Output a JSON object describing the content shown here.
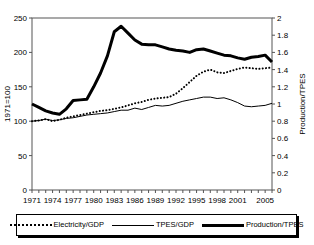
{
  "chart_data": {
    "type": "line",
    "title": "",
    "xlabel": "",
    "ylabel": "1971=100",
    "y2label": "Production/TPES",
    "x": [
      1971,
      1972,
      1973,
      1974,
      1975,
      1976,
      1977,
      1978,
      1979,
      1980,
      1981,
      1982,
      1983,
      1984,
      1985,
      1986,
      1987,
      1988,
      1989,
      1990,
      1991,
      1992,
      1993,
      1994,
      1995,
      1996,
      1997,
      1998,
      1999,
      2000,
      2001,
      2002,
      2003,
      2004,
      2005,
      2006
    ],
    "xtick_labels": [
      "1971",
      "1974",
      "1977",
      "1980",
      "1983",
      "1986",
      "1989",
      "1992",
      "1995",
      "1998",
      "2001",
      "2005"
    ],
    "xtick_values": [
      1971,
      1974,
      1977,
      1980,
      1983,
      1986,
      1989,
      1992,
      1995,
      1998,
      2001,
      2005
    ],
    "ylim": [
      0,
      250
    ],
    "ytick_labels": [
      "0",
      "50",
      "100",
      "150",
      "200",
      "250"
    ],
    "ytick_values": [
      0,
      50,
      100,
      150,
      200,
      250
    ],
    "y2lim": [
      0,
      2
    ],
    "y2tick_labels": [
      "0",
      "0.2",
      "0.4",
      "0.6",
      "0.8",
      "1",
      "1.2",
      "1.4",
      "1.6",
      "1.8",
      "2"
    ],
    "y2tick_values": [
      0,
      0.2,
      0.4,
      0.6,
      0.8,
      1,
      1.2,
      1.4,
      1.6,
      1.8,
      2
    ],
    "grid": false,
    "legend_position": "bottom",
    "series": [
      {
        "name": "Electricity/GDP",
        "style": "dotted",
        "axis": "left",
        "values": [
          100,
          101,
          103,
          100,
          102,
          105,
          107,
          109,
          111,
          113,
          115,
          116,
          118,
          120,
          123,
          126,
          128,
          131,
          133,
          134,
          135,
          140,
          148,
          157,
          166,
          172,
          175,
          171,
          170,
          173,
          176,
          178,
          177,
          176,
          177,
          178
        ]
      },
      {
        "name": "TPES/GDP",
        "style": "thin",
        "axis": "left",
        "values": [
          100,
          101,
          103,
          101,
          102,
          104,
          105,
          107,
          109,
          110,
          111,
          112,
          114,
          116,
          116,
          119,
          117,
          120,
          123,
          122,
          123,
          126,
          129,
          131,
          133,
          135,
          135,
          133,
          134,
          131,
          127,
          122,
          121,
          122,
          123,
          126
        ]
      },
      {
        "name": "Production/TPES",
        "style": "thick",
        "axis": "left",
        "values": [
          125,
          120,
          115,
          112,
          110,
          118,
          130,
          131,
          132,
          150,
          170,
          195,
          230,
          238,
          228,
          218,
          212,
          211,
          211,
          208,
          205,
          203,
          202,
          200,
          204,
          205,
          202,
          199,
          196,
          195,
          192,
          190,
          193,
          194,
          196,
          186
        ]
      }
    ]
  },
  "legend": {
    "items": [
      {
        "label": "Electricity/GDP",
        "style": "dotted"
      },
      {
        "label": "TPES/GDP",
        "style": "thin"
      },
      {
        "label": "Production/TPES",
        "style": "thick"
      }
    ]
  }
}
